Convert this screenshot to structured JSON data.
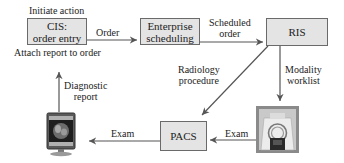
{
  "diagram": {
    "nodes": {
      "cis": {
        "line1": "CIS:",
        "line2": "order entry"
      },
      "enterprise": {
        "line1": "Enterprise",
        "line2": "scheduling"
      },
      "ris": {
        "label": "RIS"
      },
      "pacs": {
        "label": "PACS"
      },
      "workstation": {
        "icon": "monitor-icon"
      },
      "modality": {
        "icon": "mri-scanner-icon"
      }
    },
    "labels": {
      "initiate_action": "Initiate action",
      "attach_report": "Attach report to order",
      "order": "Order",
      "scheduled_line1": "Scheduled",
      "scheduled_line2": "order",
      "radiology_line1": "Radiology",
      "radiology_line2": "procedure",
      "modality_line1": "Modality",
      "modality_line2": "worklist",
      "diagnostic_line1": "Diagnostic",
      "diagnostic_line2": "report",
      "exam_pacs_to_monitor": "Exam",
      "exam_mri_to_pacs": "Exam"
    },
    "edges": [
      {
        "from": "cis",
        "to": "enterprise",
        "label": "Order"
      },
      {
        "from": "enterprise",
        "to": "ris",
        "label": "Scheduled order"
      },
      {
        "from": "ris",
        "to": "pacs",
        "label": "Radiology procedure"
      },
      {
        "from": "ris",
        "to": "modality",
        "label": "Modality worklist"
      },
      {
        "from": "modality",
        "to": "pacs",
        "label": "Exam"
      },
      {
        "from": "pacs",
        "to": "workstation",
        "label": "Exam"
      },
      {
        "from": "workstation",
        "to": "cis",
        "label": "Diagnostic report"
      }
    ],
    "colors": {
      "box_fill": "#e4e4e4",
      "box_border": "#6a6a6a",
      "line": "#555555"
    }
  }
}
